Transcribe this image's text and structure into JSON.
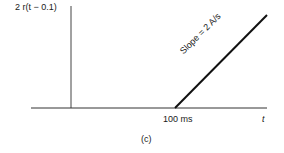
{
  "diagram": {
    "y_label": "2 r(t − 0.1)",
    "slope_label": "Slope = 2 A/s",
    "x_tick_label": "100 ms",
    "x_axis_label": "t",
    "caption": "(c)"
  },
  "colors": {
    "line": "#1a1a1a",
    "axis": "#333333",
    "background": "#ffffff"
  }
}
